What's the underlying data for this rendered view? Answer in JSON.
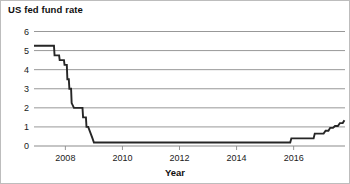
{
  "chart_data": {
    "type": "line",
    "title": "US fed fund rate",
    "xlabel": "Year",
    "ylabel": "",
    "xlim": [
      2006.9,
      2017.8
    ],
    "ylim": [
      0,
      6
    ],
    "grid": true,
    "legend": "none",
    "yticks": [
      0,
      1,
      2,
      3,
      4,
      5,
      6
    ],
    "ytick_labels": [
      "0",
      "1",
      "2",
      "3",
      "4",
      "5",
      "6"
    ],
    "xticks": [
      2008,
      2010,
      2012,
      2014,
      2016
    ],
    "xtick_labels": [
      "2008",
      "2010",
      "2012",
      "2014",
      "2016"
    ],
    "line_color": "#262626",
    "grid_color": "#8c8c8c",
    "series": [
      {
        "name": "US fed fund rate",
        "x": [
          2006.9,
          2007.6,
          2007.62,
          2007.78,
          2007.8,
          2007.95,
          2007.97,
          2008.05,
          2008.07,
          2008.12,
          2008.14,
          2008.2,
          2008.22,
          2008.3,
          2008.6,
          2008.62,
          2008.72,
          2008.74,
          2008.8,
          2008.95,
          2009.0,
          2015.88,
          2015.92,
          2016.7,
          2016.74,
          2017.05,
          2017.12,
          2017.22,
          2017.28,
          2017.38,
          2017.45,
          2017.55,
          2017.62,
          2017.72,
          2017.78
        ],
        "y": [
          5.25,
          5.25,
          4.75,
          4.75,
          4.5,
          4.5,
          4.25,
          4.25,
          3.5,
          3.5,
          3.0,
          3.0,
          2.25,
          2.0,
          2.0,
          1.5,
          1.5,
          1.0,
          1.0,
          0.4,
          0.18,
          0.18,
          0.4,
          0.4,
          0.65,
          0.65,
          0.8,
          0.8,
          0.95,
          0.95,
          1.05,
          1.05,
          1.2,
          1.2,
          1.35
        ]
      }
    ]
  }
}
